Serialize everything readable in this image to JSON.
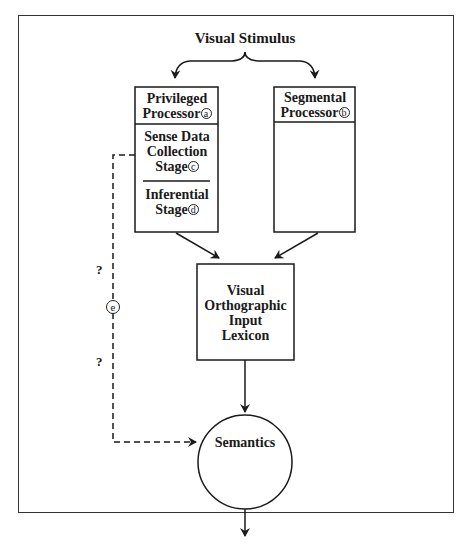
{
  "diagram": {
    "title": "Visual Stimulus",
    "nodes": {
      "privileged_processor": {
        "line1": "Privileged",
        "line2": "Processor",
        "marker": "a"
      },
      "sense_data_stage": {
        "line1": "Sense Data",
        "line2": "Collection",
        "line3": "Stage",
        "marker": "c"
      },
      "inferential_stage": {
        "line1": "Inferential",
        "line2": "Stage",
        "marker": "d"
      },
      "segmental_processor": {
        "line1": "Segmental",
        "line2": "Processor",
        "marker": "b"
      },
      "lexicon": {
        "line1": "Visual",
        "line2": "Orthographic",
        "line3": "Input",
        "line4": "Lexicon"
      },
      "semantics": {
        "label": "Semantics"
      }
    },
    "dashed_route": {
      "marker": "e",
      "question_top": "?",
      "question_bottom": "?"
    },
    "edges": [
      {
        "from": "Visual Stimulus",
        "to": "Privileged Processor",
        "style": "solid"
      },
      {
        "from": "Visual Stimulus",
        "to": "Segmental Processor",
        "style": "solid"
      },
      {
        "from": "Privileged Processor",
        "to": "Visual Orthographic Input Lexicon",
        "style": "solid"
      },
      {
        "from": "Segmental Processor",
        "to": "Visual Orthographic Input Lexicon",
        "style": "solid"
      },
      {
        "from": "Visual Orthographic Input Lexicon",
        "to": "Semantics",
        "style": "solid"
      },
      {
        "from": "Sense Data Collection Stage",
        "to": "Semantics",
        "style": "dashed",
        "marker": "e"
      },
      {
        "from": "Semantics",
        "to": "output",
        "style": "solid"
      }
    ]
  }
}
